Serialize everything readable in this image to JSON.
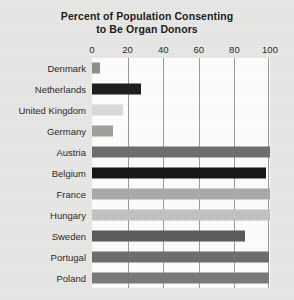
{
  "chart_data": {
    "type": "bar",
    "orientation": "horizontal",
    "title": "Percent of Population Consenting to Be Organ Donors",
    "title_lines": [
      "Percent of Population Consenting",
      "to Be Organ Donors"
    ],
    "xlabel": "",
    "ylabel": "",
    "xlim": [
      0,
      100
    ],
    "xticks": [
      0,
      20,
      40,
      60,
      80,
      100
    ],
    "xtick_labels": [
      "0",
      "20",
      "40",
      "60",
      "80",
      "100"
    ],
    "grid": true,
    "grid_axis": "x",
    "legend": "none",
    "categories": [
      "Denmark",
      "Netherlands",
      "United Kingdom",
      "Germany",
      "Austria",
      "Belgium",
      "France",
      "Hungary",
      "Sweden",
      "Portugal",
      "Poland"
    ],
    "values": [
      4.25,
      27.5,
      17.17,
      12,
      99.98,
      98,
      99.91,
      99.97,
      85.9,
      99.64,
      99.5
    ],
    "bar_colors": [
      "#8f8f8d",
      "#201f1d",
      "#d9d9d7",
      "#a0a09e",
      "#6f6f6d",
      "#191817",
      "#aaaaa8",
      "#c2c2c0",
      "#5c5c5a",
      "#6e6e6c",
      "#7a7a78"
    ]
  },
  "figure": {
    "background_color": "#e7e7e6",
    "plot_background_color": "#fdfdfd",
    "gridline_color": "#9a9a98",
    "text_color": "#2b2b29"
  }
}
